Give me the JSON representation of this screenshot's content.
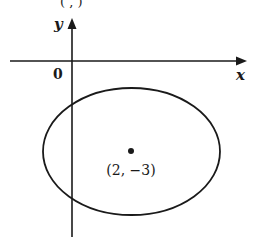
{
  "diagram": {
    "type": "ellipse-on-coordinate-plane",
    "top_fragment": "(   ,   )",
    "axes": {
      "x_label": "x",
      "y_label": "y",
      "origin_label": "0"
    },
    "ellipse": {
      "center_label": "(2, −3)",
      "center": [
        2,
        -3
      ]
    },
    "colors": {
      "stroke": "#1a1a1a",
      "background": "#ffffff"
    }
  }
}
